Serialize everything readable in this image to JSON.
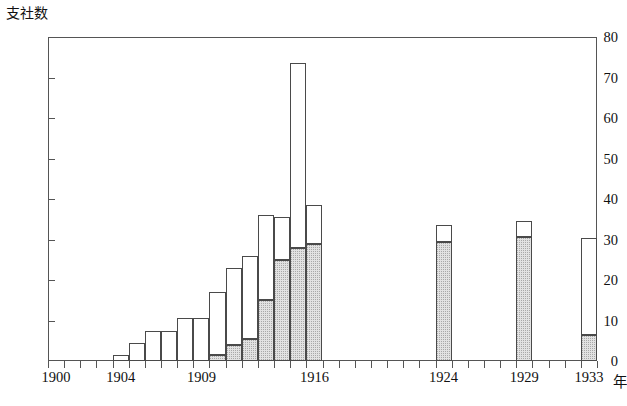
{
  "chart_data": {
    "type": "bar",
    "title": "",
    "subtitle": "",
    "ylabel": "支社数",
    "xlabel": "年",
    "x_unit_label": "年",
    "ylim": [
      0,
      80
    ],
    "xlim": [
      1900,
      1934
    ],
    "grid": false,
    "legend": "none",
    "stacked": true,
    "y_ticks": [
      0,
      10,
      20,
      30,
      40,
      50,
      60,
      70,
      80
    ],
    "x_tick_years": [
      1900,
      1901,
      1902,
      1903,
      1904,
      1905,
      1906,
      1907,
      1908,
      1909,
      1910,
      1911,
      1912,
      1913,
      1914,
      1915,
      1916,
      1917,
      1924,
      1929,
      1933
    ],
    "x_tick_labels": [
      "1900",
      "1904",
      "1909",
      "1916",
      "1924",
      "1929",
      "1933"
    ],
    "x_labeled_years": [
      1900,
      1904,
      1909,
      1916,
      1924,
      1929,
      1933
    ],
    "categories": [
      "1904",
      "1905",
      "1906",
      "1907",
      "1908",
      "1909",
      "1910",
      "1911",
      "1912",
      "1913",
      "1914",
      "1915",
      "1916",
      "1924",
      "1929",
      "1933"
    ],
    "series": [
      {
        "name": "shaded",
        "fill": "gray-stipple",
        "values": [
          0,
          0,
          0,
          0,
          0,
          0,
          1.5,
          4,
          5.5,
          15,
          25,
          28,
          29,
          29.5,
          30.5,
          6.5
        ]
      },
      {
        "name": "open",
        "fill": "white",
        "values": [
          1.5,
          4.5,
          7.5,
          7.5,
          10.5,
          10.5,
          15.5,
          19,
          20.5,
          21,
          10.5,
          45.5,
          9.5,
          4,
          4,
          24
        ]
      }
    ],
    "totals": [
      1.5,
      4.5,
      7.5,
      7.5,
      10.5,
      10.5,
      17,
      23,
      26,
      36,
      35.5,
      73.5,
      38.5,
      33.5,
      34.5,
      30.5
    ]
  },
  "colors": {
    "axis": "#555555",
    "bar_outline": "#4a4a4a",
    "bar_open_fill": "#ffffff",
    "bar_shaded_fill": "#e2e2e2",
    "background": "#ffffff",
    "text": "#111111"
  }
}
